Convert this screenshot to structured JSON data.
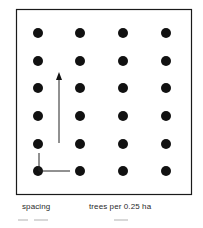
{
  "diagram": {
    "grid": {
      "columns": 4,
      "rows": 6,
      "column_x": [
        38,
        80,
        123,
        166
      ],
      "row_y": [
        33,
        61,
        88,
        116,
        144,
        171
      ],
      "dot_radius": 5,
      "dot_color": "#111111"
    },
    "frame": {
      "x": 16,
      "y": 9,
      "width": 175,
      "height": 185,
      "stroke": "#1a1a1a"
    },
    "arrow": {
      "x": 59,
      "y_start": 143,
      "y_end": 72
    },
    "spacing_marker": {
      "corner_x": 39,
      "corner_y": 171,
      "vertical_top": 153,
      "horizontal_right": 70
    }
  },
  "labels": {
    "spacing": "spacing",
    "trees_per_area": "trees per 0.25 ha"
  }
}
